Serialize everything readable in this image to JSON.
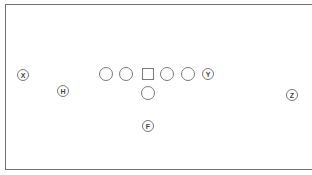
{
  "diagram": {
    "type": "football-formation",
    "border_color": "#707070",
    "marker_color": "#7a7a7a",
    "label_color": "#444444",
    "players": [
      {
        "id": "x",
        "role": "receiver",
        "shape": "labeled-circle",
        "label": "X",
        "cx": 23,
        "cy": 75
      },
      {
        "id": "h",
        "role": "slot",
        "shape": "labeled-circle",
        "label": "H",
        "cx": 63,
        "cy": 91
      },
      {
        "id": "lt",
        "role": "left-tackle",
        "shape": "circle",
        "label": "",
        "cx": 106,
        "cy": 74
      },
      {
        "id": "lg",
        "role": "left-guard",
        "shape": "circle",
        "label": "",
        "cx": 126,
        "cy": 74
      },
      {
        "id": "c",
        "role": "center",
        "shape": "square",
        "label": "",
        "cx": 148,
        "cy": 74
      },
      {
        "id": "rg",
        "role": "right-guard",
        "shape": "circle",
        "label": "",
        "cx": 167,
        "cy": 74
      },
      {
        "id": "rt",
        "role": "right-tackle",
        "shape": "circle",
        "label": "",
        "cx": 188,
        "cy": 74
      },
      {
        "id": "y",
        "role": "tight-end",
        "shape": "labeled-circle",
        "label": "Y",
        "cx": 208,
        "cy": 74
      },
      {
        "id": "qb",
        "role": "quarterback",
        "shape": "circle",
        "label": "",
        "cx": 148,
        "cy": 93
      },
      {
        "id": "f",
        "role": "fullback",
        "shape": "labeled-circle",
        "label": "F",
        "cx": 148,
        "cy": 126
      },
      {
        "id": "z",
        "role": "flanker",
        "shape": "labeled-circle",
        "label": "Z",
        "cx": 292,
        "cy": 95
      }
    ]
  }
}
